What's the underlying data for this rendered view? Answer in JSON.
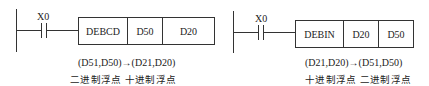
{
  "diagrams": [
    {
      "contact_label": "X0",
      "instruction": "DEBCD",
      "operand1": "D50",
      "operand2": "D20",
      "transfer_note": "(D51,D50)→(D21,D20)",
      "format_note": "二进制浮点 十进制浮点"
    },
    {
      "contact_label": "X0",
      "instruction": "DEBIN",
      "operand1": "D20",
      "operand2": "D50",
      "transfer_note": "(D21,D20)→(D51,D50)",
      "format_note": "十进制浮点 二进制浮点"
    }
  ],
  "colors": {
    "line": "#333333",
    "text": "#222222",
    "background": "#ffffff"
  }
}
